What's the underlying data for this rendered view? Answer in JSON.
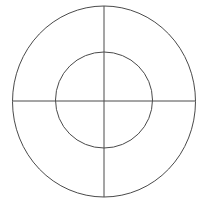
{
  "figure": {
    "canvas": {
      "width": 206,
      "height": 210,
      "background_color": "#ffffff"
    },
    "style": {
      "stroke_color": "#4a4a4a",
      "stroke_width": 1,
      "fill": "none"
    },
    "center": {
      "x": 104,
      "y": 101.5
    },
    "shapes": [
      {
        "name": "outer-circle",
        "type": "ellipse",
        "cx": 104,
        "cy": 101.5,
        "rx": 91.5,
        "ry": 95.5,
        "stroke_color": "#4a4a4a",
        "stroke_width": 1
      },
      {
        "name": "inner-circle",
        "type": "ellipse",
        "cx": 104,
        "cy": 100,
        "rx": 48.5,
        "ry": 48,
        "stroke_color": "#4a4a4a",
        "stroke_width": 1
      },
      {
        "name": "horizontal-axis",
        "type": "line",
        "x1": 12.5,
        "y1": 101,
        "x2": 195.5,
        "y2": 101,
        "stroke_color": "#4a4a4a",
        "stroke_width": 1
      },
      {
        "name": "vertical-axis",
        "type": "line",
        "x1": 104,
        "y1": 6,
        "x2": 104,
        "y2": 197,
        "stroke_color": "#4a4a4a",
        "stroke_width": 1
      }
    ],
    "labels": []
  }
}
